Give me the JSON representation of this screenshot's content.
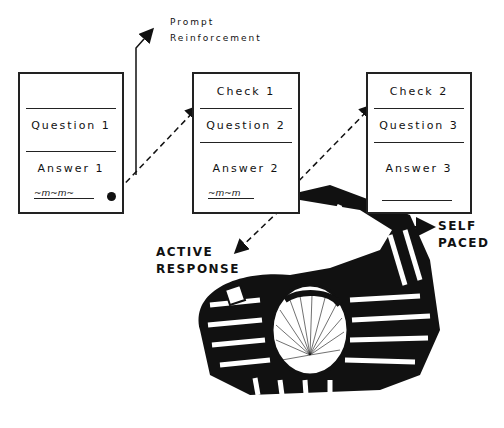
{
  "diagram": {
    "frames": [
      {
        "id": "frame-1",
        "check": "",
        "question": "Question 1",
        "answer": "Answer 1",
        "response": "written"
      },
      {
        "id": "frame-2",
        "check": "Check 1",
        "question": "Question 2",
        "answer": "Answer 2",
        "response": "written"
      },
      {
        "id": "frame-3",
        "check": "Check 2",
        "question": "Question 3",
        "answer": "Answer 3",
        "response": "blank"
      }
    ],
    "labels": {
      "prompt_line1": "Prompt",
      "prompt_line2": "Reinforcement",
      "active_line1": "ACTIVE",
      "active_line2": "RESPONSE",
      "self_line1": "SELF",
      "self_line2": "PACED"
    },
    "illustration": "striped-figure-writing-with-pen",
    "colors": {
      "ink": "#111111",
      "paper": "#ffffff"
    }
  }
}
